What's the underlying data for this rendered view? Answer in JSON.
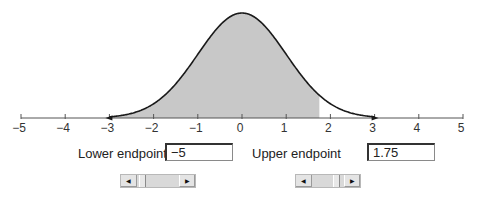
{
  "chart_data": {
    "type": "area",
    "title": "",
    "xlabel": "",
    "ylabel": "",
    "distribution": {
      "name": "standard normal",
      "mean": 0,
      "sd": 1
    },
    "curve_range": [
      -3,
      3
    ],
    "xlim": [
      -5,
      5
    ],
    "x_ticks": [
      -5,
      -4,
      -3,
      -2,
      -1,
      0,
      1,
      2,
      3,
      4,
      5
    ],
    "x_tick_labels": [
      "−5",
      "−4",
      "−3",
      "−2",
      "−1",
      "0",
      "1",
      "2",
      "3",
      "4",
      "5"
    ],
    "shaded_region": {
      "from": -5,
      "to": 1.75,
      "color": "#c8c8c8"
    },
    "grid": false,
    "legend": null
  },
  "controls": {
    "lower": {
      "label": "Lower endpoint",
      "value": "−5",
      "scroll_min": -5,
      "scroll_max": 5,
      "scroll_value": -5
    },
    "upper": {
      "label": "Upper endpoint",
      "value": "1.75",
      "scroll_min": -5,
      "scroll_max": 5,
      "scroll_value": 1.75
    },
    "scroll_left_icon": "◀",
    "scroll_right_icon": "▶"
  },
  "colors": {
    "curve": "#1a1a1a",
    "shade": "#c8c8c8",
    "axis": "#555555"
  }
}
